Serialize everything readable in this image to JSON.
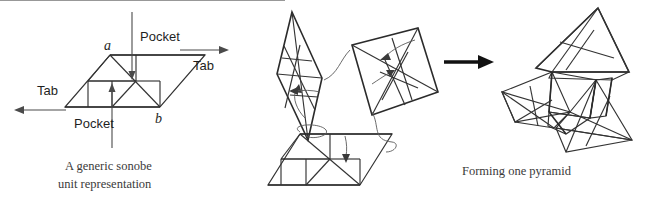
{
  "figure": {
    "background": "#ffffff"
  },
  "palette": {
    "light_fill": "#dcdcdc",
    "mid_fill": "#b4b4b4",
    "dark_fill": "#8a8a8a",
    "darker_fill": "#777777",
    "pale_fill": "#eaeaea",
    "stroke": "#333333",
    "arrow_black": "#111111",
    "text": "#2b2b2b"
  },
  "panels": {
    "left": {
      "name": "generic-sonobe-unit",
      "caption_line1": "A generic sonobe",
      "caption_line2": "unit representation",
      "labels": {
        "pocket_top": "Pocket",
        "pocket_bottom": "Pocket",
        "tab_left": "Tab",
        "tab_right": "Tab",
        "vertex_a": "a",
        "vertex_b": "b"
      }
    },
    "middle": {
      "name": "three-units-assembly",
      "units": [
        {
          "id": "unit-dark-left",
          "fill": "#8a8a8a"
        },
        {
          "id": "unit-mid-right",
          "fill": "#b4b4b4"
        },
        {
          "id": "unit-light-bottom",
          "fill": "#dcdcdc"
        }
      ]
    },
    "transition": {
      "name": "transition-arrow",
      "glyph": "arrow-right"
    },
    "right": {
      "name": "formed-pyramid",
      "caption": "Forming one pyramid"
    }
  }
}
